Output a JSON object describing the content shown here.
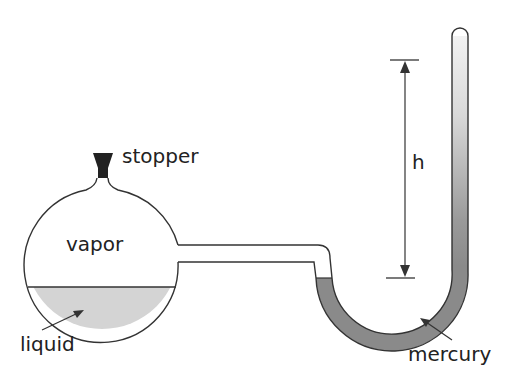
{
  "diagram": {
    "type": "manometer-apparatus",
    "labels": {
      "stopper": "stopper",
      "vapor": "vapor",
      "liquid": "liquid",
      "height": "h",
      "mercury": "mercury"
    },
    "colors": {
      "outline": "#333333",
      "liquid_fill": "#d4d4d4",
      "mercury_fill": "#8a8a8a",
      "mercury_column_top": "#efefef",
      "stopper_fill": "#222222"
    }
  }
}
